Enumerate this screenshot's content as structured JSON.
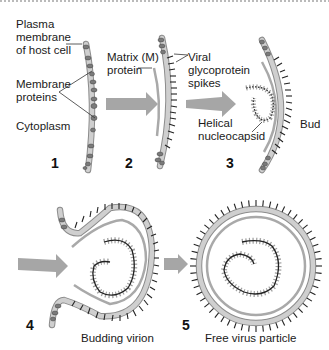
{
  "colors": {
    "membrane": "#c9c9c9",
    "membrane_edge": "#8c8c8c",
    "protein": "#7a7a7a",
    "matrix": "#a9a9a9",
    "spike": "#222222",
    "arrow": "#a6a6a6",
    "leader": "#333333"
  },
  "labels": {
    "plasma_membrane": "Plasma\nmembrane\nof host cell",
    "membrane_proteins": "Membrane\nproteins",
    "cytoplasm": "Cytoplasm",
    "matrix_protein": "Matrix (M)\nprotein",
    "viral_spikes": "Viral\nglycoprotein\nspikes",
    "helical_nucleocapsid": "Helical\nnucleocapsid",
    "bud": "Bud",
    "budding_virion": "Budding virion",
    "free_virus": "Free virus particle"
  },
  "steps": [
    {
      "number": "1"
    },
    {
      "number": "2"
    },
    {
      "number": "3"
    },
    {
      "number": "4"
    },
    {
      "number": "5"
    }
  ]
}
